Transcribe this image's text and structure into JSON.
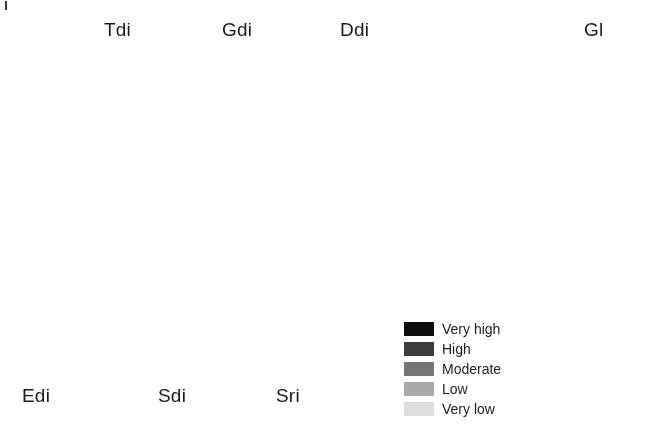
{
  "figure": {
    "type": "map-figure",
    "background_color": "#ffffff",
    "width": 653,
    "height": 445,
    "scan_artifact": true
  },
  "legend": {
    "title": "",
    "position": "bottom-center-right",
    "items": [
      {
        "label": "Very high",
        "color": "#0d0d0d"
      },
      {
        "label": "High",
        "color": "#3c3c3c"
      },
      {
        "label": "Moderate",
        "color": "#767676"
      },
      {
        "label": "Low",
        "color": "#a9a9a9"
      },
      {
        "label": "Very low",
        "color": "#dedede"
      }
    ]
  },
  "palette": {
    "very_high": "#0d0d0d",
    "high": "#3c3c3c",
    "moderate": "#767676",
    "low": "#a9a9a9",
    "very_low": "#dedede",
    "outline": "#9a9a9a",
    "nodata": "#ffffff"
  },
  "panels": [
    {
      "id": "tdi",
      "label": "Tdi",
      "label_position": "top-right",
      "box": {
        "x": 24,
        "y": 32,
        "w": 98,
        "h": 190
      },
      "label_box": {
        "x": 104,
        "y": 20,
        "w": 44,
        "h": 24
      },
      "map_scale": "small",
      "seed": 1117,
      "render": {
        "style": "network",
        "base_class": 4,
        "patch_class": 3,
        "line_class": 2,
        "line_accent_class": 1,
        "patch_density": 0.16,
        "line_count": 14,
        "line_width": 2.1,
        "speck_density": 0.012
      },
      "class_fractions": {
        "very_high": 0.01,
        "high": 0.05,
        "moderate": 0.14,
        "low": 0.22,
        "very_low": 0.58
      }
    },
    {
      "id": "gdi",
      "label": "Gdi",
      "label_position": "top-right",
      "box": {
        "x": 144,
        "y": 32,
        "w": 98,
        "h": 190
      },
      "label_box": {
        "x": 222,
        "y": 20,
        "w": 46,
        "h": 24
      },
      "map_scale": "small",
      "seed": 2243,
      "render": {
        "style": "mottled",
        "base_class": 3,
        "patch_class": 2,
        "line_class": 1,
        "line_accent_class": 0,
        "patch_density": 0.48,
        "line_count": 16,
        "line_width": 1.5,
        "speck_density": 0.1,
        "noise_scale": 7
      },
      "class_fractions": {
        "very_high": 0.03,
        "high": 0.13,
        "moderate": 0.33,
        "low": 0.29,
        "very_low": 0.22
      }
    },
    {
      "id": "ddi",
      "label": "Ddi",
      "label_position": "top-right",
      "box": {
        "x": 262,
        "y": 28,
        "w": 104,
        "h": 196
      },
      "label_box": {
        "x": 340,
        "y": 20,
        "w": 46,
        "h": 24
      },
      "map_scale": "small",
      "seed": 3361,
      "render": {
        "style": "solid-specks",
        "base_class": 2,
        "patch_class": 2,
        "line_class": 2,
        "line_accent_class": 1,
        "patch_density": 0.0,
        "line_count": 0,
        "line_width": 1.0,
        "speck_density": 0.055,
        "speck_class": 5
      },
      "class_fractions": {
        "very_high": 0.0,
        "high": 0.01,
        "moderate": 0.93,
        "low": 0.02,
        "very_low": 0.04
      }
    },
    {
      "id": "edi",
      "label": "Edi",
      "label_position": "bottom-left",
      "box": {
        "x": 38,
        "y": 238,
        "w": 96,
        "h": 170
      },
      "label_box": {
        "x": 22,
        "y": 386,
        "w": 44,
        "h": 24
      },
      "map_scale": "small",
      "seed": 4409,
      "render": {
        "style": "mottled",
        "base_class": 3,
        "patch_class": 2,
        "line_class": 1,
        "line_accent_class": 0,
        "patch_density": 0.4,
        "line_count": 10,
        "line_width": 1.4,
        "speck_density": 0.07,
        "noise_scale": 6
      },
      "class_fractions": {
        "very_high": 0.02,
        "high": 0.09,
        "moderate": 0.28,
        "low": 0.33,
        "very_low": 0.28
      }
    },
    {
      "id": "sdi",
      "label": "Sdi",
      "label_position": "bottom-left",
      "box": {
        "x": 152,
        "y": 234,
        "w": 98,
        "h": 176
      },
      "label_box": {
        "x": 158,
        "y": 386,
        "w": 44,
        "h": 24
      },
      "map_scale": "small",
      "seed": 5527,
      "render": {
        "style": "mottled",
        "base_class": 2,
        "patch_class": 1,
        "line_class": 1,
        "line_accent_class": 0,
        "patch_density": 0.46,
        "line_count": 20,
        "line_width": 1.6,
        "speck_density": 0.13,
        "noise_scale": 5
      },
      "class_fractions": {
        "very_high": 0.05,
        "high": 0.24,
        "moderate": 0.45,
        "low": 0.15,
        "very_low": 0.11
      }
    },
    {
      "id": "sri",
      "label": "Sri",
      "label_position": "bottom-left",
      "box": {
        "x": 268,
        "y": 234,
        "w": 98,
        "h": 176
      },
      "label_box": {
        "x": 276,
        "y": 386,
        "w": 44,
        "h": 24
      },
      "map_scale": "small",
      "seed": 6673,
      "render": {
        "style": "mottled",
        "base_class": 3,
        "patch_class": 2,
        "line_class": 1,
        "line_accent_class": 0,
        "patch_density": 0.44,
        "line_count": 22,
        "line_width": 1.5,
        "speck_density": 0.11,
        "noise_scale": 5
      },
      "class_fractions": {
        "very_high": 0.04,
        "high": 0.18,
        "moderate": 0.36,
        "low": 0.26,
        "very_low": 0.16
      }
    },
    {
      "id": "gl",
      "label": "Gl",
      "label_position": "top-right",
      "box": {
        "x": 396,
        "y": 26,
        "w": 232,
        "h": 404
      },
      "label_box": {
        "x": 584,
        "y": 20,
        "w": 40,
        "h": 24
      },
      "map_scale": "large",
      "seed": 8191,
      "render": {
        "style": "blocky",
        "base_class": 2,
        "patch_class": 3,
        "line_class": 1,
        "line_accent_class": 0,
        "patch_density": 0.42,
        "cell_size": 5,
        "speck_density": 0.05,
        "noise_scale": 3
      },
      "class_fractions": {
        "very_high": 0.04,
        "high": 0.17,
        "moderate": 0.38,
        "low": 0.27,
        "very_low": 0.14
      }
    }
  ]
}
